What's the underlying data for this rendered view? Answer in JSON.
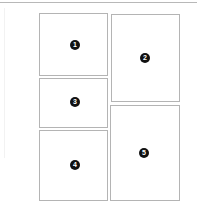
{
  "layout": {
    "panels": [
      {
        "label": "1",
        "x": 39,
        "y": 13,
        "w": 69,
        "h": 63,
        "badge_x": 35,
        "badge_y": 31
      },
      {
        "label": "2",
        "x": 111,
        "y": 14,
        "w": 69,
        "h": 88,
        "badge_x": 33,
        "badge_y": 43
      },
      {
        "label": "3",
        "x": 39,
        "y": 78,
        "w": 69,
        "h": 50,
        "badge_x": 35,
        "badge_y": 23
      },
      {
        "label": "4",
        "x": 39,
        "y": 130,
        "w": 69,
        "h": 71,
        "badge_x": 35,
        "badge_y": 34
      },
      {
        "label": "5",
        "x": 110,
        "y": 105,
        "w": 70,
        "h": 96,
        "badge_x": 33,
        "badge_y": 47
      }
    ]
  },
  "colors": {
    "panel_border": "#b4b4b4",
    "badge_fill": "#111111",
    "badge_text": "#ffffff"
  }
}
